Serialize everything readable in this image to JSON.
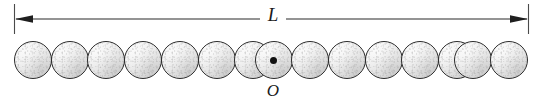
{
  "figure": {
    "type": "physics-diagram",
    "background_color": "#ffffff"
  },
  "dimension": {
    "label": "L",
    "name": "length-dimension",
    "arrow_style": "double-headed",
    "tick_color": "#3a3a3a",
    "line_color": "#2b2b2b",
    "line_y": 19,
    "left_tick_x": 14,
    "right_tick_x": 528,
    "tick_top": 4,
    "tick_bottom": 34
  },
  "origin": {
    "label": "O",
    "name": "origin-marker",
    "dot_color": "#111111",
    "dot_diameter": 7,
    "center_x": 273,
    "center_y": 60
  },
  "chain": {
    "count": 15,
    "sphere_diameter": 38,
    "first_left": 14,
    "spacing": 36.7,
    "top": 41,
    "outline_color": "#2b2b2b",
    "fill_color": "#f0f0f0",
    "center_index": 7,
    "spheres": [
      {
        "index": 0,
        "left": 14,
        "marked": false
      },
      {
        "index": 1,
        "left": 50,
        "marked": false
      },
      {
        "index": 2,
        "left": 87,
        "marked": false
      },
      {
        "index": 3,
        "left": 124,
        "marked": false
      },
      {
        "index": 4,
        "left": 161,
        "marked": false
      },
      {
        "index": 5,
        "left": 198,
        "marked": false
      },
      {
        "index": 6,
        "left": 235,
        "marked": false
      },
      {
        "index": 7,
        "left": 254,
        "marked": true
      },
      {
        "index": 8,
        "left": 291,
        "marked": false
      },
      {
        "index": 9,
        "left": 328,
        "marked": false
      },
      {
        "index": 10,
        "left": 364,
        "marked": false
      },
      {
        "index": 11,
        "left": 401,
        "marked": false
      },
      {
        "index": 12,
        "left": 438,
        "marked": false
      },
      {
        "index": 13,
        "left": 454,
        "marked": false
      },
      {
        "index": 14,
        "left": 490,
        "marked": false
      }
    ]
  }
}
